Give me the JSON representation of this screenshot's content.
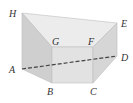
{
  "diagram": {
    "type": "prism-3d",
    "vertices": [
      {
        "id": "H",
        "label": "H",
        "x": 22,
        "y": 13,
        "lx": 9,
        "ly": 17
      },
      {
        "id": "E",
        "label": "E",
        "x": 117,
        "y": 23,
        "lx": 121,
        "ly": 27
      },
      {
        "id": "G",
        "label": "G",
        "x": 52,
        "y": 47,
        "lx": 52,
        "ly": 45
      },
      {
        "id": "F",
        "label": "F",
        "x": 93,
        "y": 47,
        "lx": 88,
        "ly": 45
      },
      {
        "id": "D",
        "label": "D",
        "x": 117,
        "y": 56,
        "lx": 121,
        "ly": 61
      },
      {
        "id": "A",
        "label": "A",
        "x": 22,
        "y": 69,
        "lx": 9,
        "ly": 73
      },
      {
        "id": "B",
        "label": "B",
        "x": 52,
        "y": 83,
        "lx": 47,
        "ly": 95
      },
      {
        "id": "C",
        "label": "C",
        "x": 93,
        "y": 83,
        "lx": 90,
        "ly": 95
      }
    ],
    "dashed_segment": [
      "A",
      "D"
    ],
    "colors": {
      "top_face": "#ececec",
      "left_face": "#cfcfcf",
      "front_face": "#e2e2e2",
      "right_face": "#d6d6d6",
      "edge": "#bdbdbd",
      "dashed": "#444444",
      "label": "#333333"
    }
  }
}
